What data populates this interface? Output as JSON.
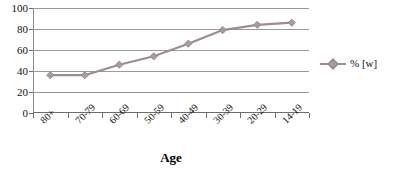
{
  "chart_data": {
    "type": "line",
    "title": "",
    "subtitle": "",
    "xlabel": "Age",
    "ylabel": "",
    "categories": [
      "80+",
      "70-79",
      "60-69",
      "50-59",
      "40-49",
      "30-39",
      "20-29",
      "14-19"
    ],
    "series": [
      {
        "name": "% [w]",
        "values": [
          36,
          36,
          46,
          54,
          66,
          79,
          84,
          86
        ],
        "color": "#9b8b94",
        "marker": "diamond"
      }
    ],
    "ylim": [
      0,
      100
    ],
    "y_ticks": [
      0,
      20,
      40,
      60,
      80,
      100
    ],
    "y_tick_labels": [
      "0",
      "20",
      "40",
      "60",
      "80",
      "100"
    ],
    "grid": "horizontal",
    "legend_position": "right",
    "legend_entries": [
      "% [w]"
    ]
  },
  "axis": {
    "x_title": "Age"
  },
  "legend": {
    "series_label": "% [w]"
  },
  "colors": {
    "series": "#9b8b94",
    "marker_fill": "#a99aa2",
    "gridline": "#9a9a9a",
    "axis": "#6d6d6d",
    "background": "#ffffff"
  }
}
